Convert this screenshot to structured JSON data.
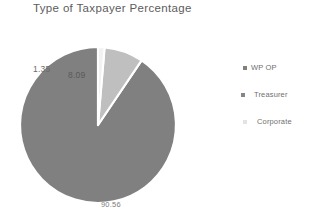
{
  "chart": {
    "title": "Type of Taxpayer Percentage",
    "background": "#FFFFFF"
  },
  "chart_data": {
    "type": "pie",
    "title": "Type of Taxpayer Percentage",
    "xlabel": "",
    "ylabel": "",
    "categories": [
      "WP OP",
      "Treasurer",
      "Corporate"
    ],
    "values": [
      90.56,
      8.09,
      1.35
    ],
    "value_labels": [
      "90.56",
      "8.09",
      "1.35"
    ],
    "colors": [
      "#808080",
      "#BFBFBF",
      "#F2F2F2"
    ],
    "slice_border_color": "#FFFFFF",
    "start_angle_deg": 0,
    "direction": "counterclockwise",
    "legend": {
      "position": "right",
      "entries": [
        {
          "label": "WP OP",
          "color": "#808080"
        },
        {
          "label": "Treasurer",
          "color": "#808080"
        },
        {
          "label": "Corporate",
          "color": "#E3E3E3"
        }
      ]
    },
    "labels": {
      "corporate": "1.35",
      "treasurer": "8.09",
      "wp_op": "90.56"
    },
    "grid": false
  }
}
